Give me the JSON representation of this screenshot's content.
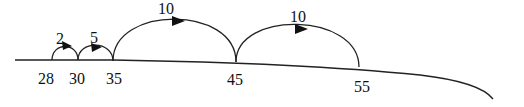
{
  "diagram": {
    "type": "open-number-line",
    "line_color": "#222222",
    "points": [
      {
        "value": "28",
        "x": 52
      },
      {
        "value": "30",
        "x": 78
      },
      {
        "value": "35",
        "x": 113
      },
      {
        "value": "45",
        "x": 236
      },
      {
        "value": "55",
        "x": 359
      }
    ],
    "jumps": [
      {
        "from": "28",
        "to": "30",
        "label": "2"
      },
      {
        "from": "30",
        "to": "35",
        "label": "5"
      },
      {
        "from": "35",
        "to": "45",
        "label": "10"
      },
      {
        "from": "45",
        "to": "55",
        "label": "10"
      }
    ]
  }
}
